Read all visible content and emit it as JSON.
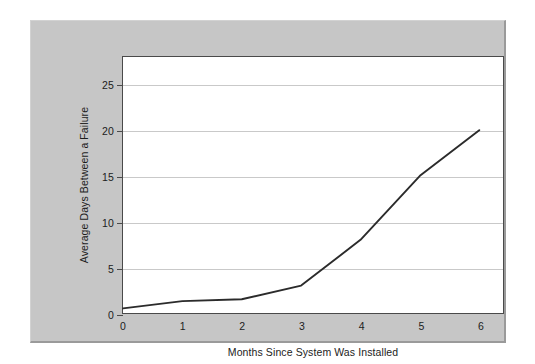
{
  "chart_data": {
    "type": "line",
    "title": "",
    "xlabel": "Months Since System Was Installed",
    "ylabel": "Average Days Between a Failure",
    "x": [
      0,
      1,
      2,
      3,
      4,
      5,
      6
    ],
    "values": [
      0.5,
      1.3,
      1.5,
      3.0,
      8.0,
      15.0,
      20.0
    ],
    "series": [
      {
        "name": "Average Days Between a Failure",
        "values": [
          0.5,
          1.3,
          1.5,
          3.0,
          8.0,
          15.0,
          20.0
        ]
      }
    ],
    "xlim": [
      0,
      6.4
    ],
    "ylim": [
      0,
      28
    ],
    "xticks": [
      0,
      1,
      2,
      3,
      4,
      5,
      6
    ],
    "xtick_labels": [
      "0",
      "1",
      "2",
      "3",
      "4",
      "5",
      "6"
    ],
    "yticks": [
      5,
      10,
      15,
      20,
      25
    ],
    "ytick_labels": [
      "5",
      "10",
      "15",
      "20",
      "25"
    ],
    "ytick_labels_all": [
      "0",
      "5",
      "10",
      "15",
      "20",
      "25"
    ],
    "grid": true,
    "grid_axis": "y",
    "legend": false,
    "legend_position": "none",
    "line_color": "#2b2b2b",
    "grid_color": "#c9c9c9",
    "plot_background": "#ffffff",
    "panel_background": "#c6c6c6",
    "axis_color": "#4a4a4a"
  },
  "axis": {
    "x_title": "Months Since System Was Installed",
    "y_title": "Average Days Between a Failure",
    "x_ticks": [
      {
        "value": 0,
        "label": "0"
      },
      {
        "value": 1,
        "label": "1"
      },
      {
        "value": 2,
        "label": "2"
      },
      {
        "value": 3,
        "label": "3"
      },
      {
        "value": 4,
        "label": "4"
      },
      {
        "value": 5,
        "label": "5"
      },
      {
        "value": 6,
        "label": "6"
      }
    ],
    "y_ticks": [
      {
        "value": 0,
        "label": "0",
        "gridline": false
      },
      {
        "value": 5,
        "label": "5",
        "gridline": true
      },
      {
        "value": 10,
        "label": "10",
        "gridline": true
      },
      {
        "value": 15,
        "label": "15",
        "gridline": true
      },
      {
        "value": 20,
        "label": "20",
        "gridline": true
      },
      {
        "value": 25,
        "label": "25",
        "gridline": true
      }
    ]
  }
}
